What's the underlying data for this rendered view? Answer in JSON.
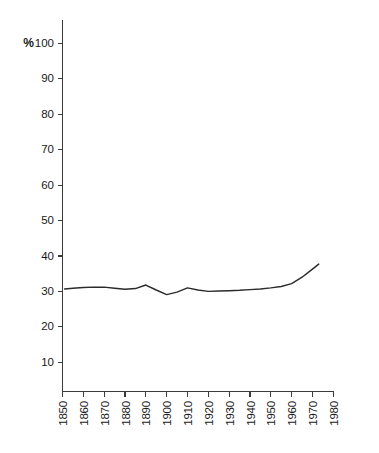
{
  "chart_data": {
    "type": "line",
    "title": "",
    "subtitle": "",
    "xlabel": "",
    "ylabel": "%",
    "unit_label": "%",
    "xlim": [
      1850,
      1980
    ],
    "ylim": [
      0,
      100
    ],
    "y_axis_min_tick": 10,
    "y_axis_max_tick": 100,
    "grid": false,
    "legend": null,
    "legend_position": "none",
    "annotations": [],
    "x_tick_labels": [
      "1850",
      "1860",
      "1870",
      "1880",
      "1890",
      "1900",
      "1910",
      "1920",
      "1930",
      "1940",
      "1950",
      "1960",
      "1970",
      "1980"
    ],
    "x_tick_values": [
      1850,
      1860,
      1870,
      1880,
      1890,
      1900,
      1910,
      1920,
      1930,
      1940,
      1950,
      1960,
      1970,
      1980
    ],
    "x_tick_label_rotation": -90,
    "y_tick_labels": [
      "10",
      "20",
      "30",
      "40",
      "50",
      "60",
      "70",
      "80",
      "90",
      "100"
    ],
    "y_tick_values": [
      10,
      20,
      30,
      40,
      50,
      60,
      70,
      80,
      90,
      100
    ],
    "series": [
      {
        "name": "",
        "color": "#2b2b2b",
        "x": [
          1851,
          1855,
          1860,
          1865,
          1870,
          1875,
          1880,
          1885,
          1890,
          1895,
          1900,
          1905,
          1910,
          1915,
          1920,
          1925,
          1930,
          1935,
          1940,
          1945,
          1950,
          1955,
          1960,
          1965,
          1970,
          1973
        ],
        "values": [
          30.7,
          30.9,
          31.1,
          31.2,
          31.2,
          30.9,
          30.6,
          30.8,
          31.8,
          30.4,
          29.1,
          29.8,
          31.0,
          30.4,
          30.0,
          30.1,
          30.2,
          30.3,
          30.5,
          30.7,
          31.0,
          31.4,
          32.2,
          34.0,
          36.3,
          37.7
        ]
      }
    ]
  },
  "figure": {
    "background_color": "#ffffff",
    "axis_color": "#3a3a3a",
    "line_color": "#2b2b2b"
  }
}
